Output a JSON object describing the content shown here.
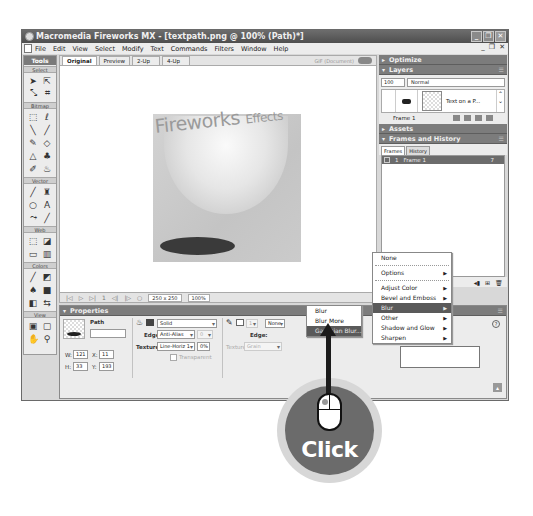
{
  "window": {
    "title": "Macromedia Fireworks MX - [textpath.png @ 100% (Path)*]",
    "controls": [
      "minimize",
      "restore",
      "close"
    ]
  },
  "menubar": {
    "items": [
      "File",
      "Edit",
      "View",
      "Select",
      "Modify",
      "Text",
      "Commands",
      "Filters",
      "Window",
      "Help"
    ],
    "mdi_controls": [
      "_",
      "❐",
      "✕"
    ]
  },
  "tools": {
    "title": "Tools",
    "sections": [
      {
        "label": "Select",
        "tools": [
          "pointer-tool",
          "subselection-tool",
          "scale-tool",
          "crop-tool"
        ]
      },
      {
        "label": "Bitmap",
        "tools": [
          "marquee-tool",
          "lasso-tool",
          "magic-wand-tool",
          "brush-tool",
          "pencil-tool",
          "eraser-tool",
          "blur-tool",
          "rubber-stamp-tool",
          "eyedropper-tool",
          "paint-bucket-tool"
        ]
      },
      {
        "label": "Vector",
        "tools": [
          "line-tool",
          "pen-tool",
          "ellipse-tool",
          "text-tool",
          "freeform-tool",
          "knife-tool"
        ]
      },
      {
        "label": "Web",
        "tools": [
          "hotspot-tool",
          "slice-tool",
          "hide-slices",
          "show-slices"
        ]
      },
      {
        "label": "Colors",
        "tools": [
          "stroke-color",
          "fill-color",
          "default-colors",
          "no-stroke",
          "swap-colors"
        ]
      },
      {
        "label": "View",
        "tools": [
          "standard-screen",
          "full-screen-menus",
          "full-screen",
          "hand-tool",
          "zoom-tool"
        ]
      }
    ]
  },
  "document": {
    "tabs": [
      "Original",
      "Preview",
      "2-Up",
      "4-Up"
    ],
    "active_tab": "Original",
    "status": "GIF (Document)",
    "canvas_text": {
      "main": "Fireworks",
      "suffix": "Effects"
    },
    "bottom_bar": {
      "size": "250 x 250",
      "zoom": "100%"
    }
  },
  "panels": {
    "optimize": {
      "title": "Optimize"
    },
    "layers": {
      "title": "Layers",
      "opacity": "100",
      "blend_mode": "Normal",
      "layer_name": "Text on a P...",
      "frame_label": "Frame 1"
    },
    "assets": {
      "title": "Assets"
    },
    "frames_history": {
      "title": "Frames and History",
      "tabs": [
        "Frames",
        "History"
      ],
      "active_tab": "Frames",
      "frames": [
        {
          "number": "1",
          "name": "Frame 1",
          "delay": "7"
        }
      ]
    }
  },
  "properties": {
    "title": "Properties",
    "object_type": "Path",
    "object_name": "",
    "fill": {
      "type": "Solid",
      "edge_label": "Edge:",
      "edge": "Anti-Alias",
      "edge_amount": "0",
      "texture_label": "Texture:",
      "texture": "Line-Horiz 1",
      "texture_amount": "0%",
      "transparent_label": "Transparent"
    },
    "stroke": {
      "size": "1",
      "type": "None",
      "edge_label": "Edge:",
      "texture_label": "Texture:",
      "texture": "Grain"
    },
    "dimensions": {
      "w_label": "W:",
      "w": "121",
      "h_label": "H:",
      "h": "33",
      "x_label": "X:",
      "x": "11",
      "y_label": "Y:",
      "y": "193"
    },
    "effects_label": "Effects:"
  },
  "effects_menu": {
    "items": [
      {
        "label": "None",
        "submenu": false
      },
      {
        "separator": true
      },
      {
        "label": "Options",
        "submenu": true
      },
      {
        "separator": true
      },
      {
        "label": "Adjust Color",
        "submenu": true
      },
      {
        "label": "Bevel and Emboss",
        "submenu": true
      },
      {
        "label": "Blur",
        "submenu": true,
        "highlighted": true
      },
      {
        "label": "Other",
        "submenu": true
      },
      {
        "label": "Shadow and Glow",
        "submenu": true
      },
      {
        "label": "Sharpen",
        "submenu": true
      }
    ]
  },
  "blur_submenu": {
    "items": [
      {
        "label": "Blur"
      },
      {
        "label": "Blur More"
      },
      {
        "label": "Gaussian Blur...",
        "highlighted": true
      }
    ]
  },
  "callout": {
    "label": "Click"
  }
}
